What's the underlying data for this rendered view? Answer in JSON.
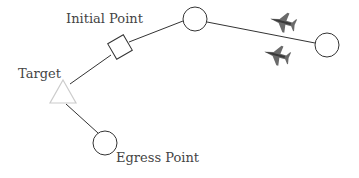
{
  "diagram": {
    "type": "mission-route",
    "labels": {
      "initial_point": "Initial Point",
      "target": "Target",
      "egress_point": "Egress Point"
    },
    "nodes": [
      {
        "id": "target",
        "shape": "triangle",
        "label": "Target",
        "cx": 63,
        "cy": 93,
        "color": "#cccccc"
      },
      {
        "id": "initial-point",
        "shape": "square",
        "label": "Initial Point",
        "cx": 120,
        "cy": 47,
        "color": "#333333"
      },
      {
        "id": "waypoint-1",
        "shape": "circle",
        "label": "",
        "cx": 195,
        "cy": 19,
        "color": "#333333"
      },
      {
        "id": "waypoint-2",
        "shape": "circle",
        "label": "",
        "cx": 327,
        "cy": 45,
        "color": "#333333"
      },
      {
        "id": "egress-point",
        "shape": "circle",
        "label": "Egress Point",
        "cx": 105,
        "cy": 143,
        "color": "#333333"
      }
    ],
    "edges": [
      [
        "waypoint-2",
        "waypoint-1"
      ],
      [
        "waypoint-1",
        "initial-point"
      ],
      [
        "initial-point",
        "target"
      ],
      [
        "target",
        "egress-point"
      ]
    ],
    "aircraft": [
      {
        "id": "jet-1",
        "icon": "fighter-jet-icon",
        "x": 283,
        "y": 22
      },
      {
        "id": "jet-2",
        "icon": "fighter-jet-icon",
        "x": 277,
        "y": 55
      }
    ],
    "colors": {
      "stroke": "#333333",
      "target": "#cccccc",
      "label": "#444444",
      "aircraft": "#5a5a5a"
    }
  }
}
